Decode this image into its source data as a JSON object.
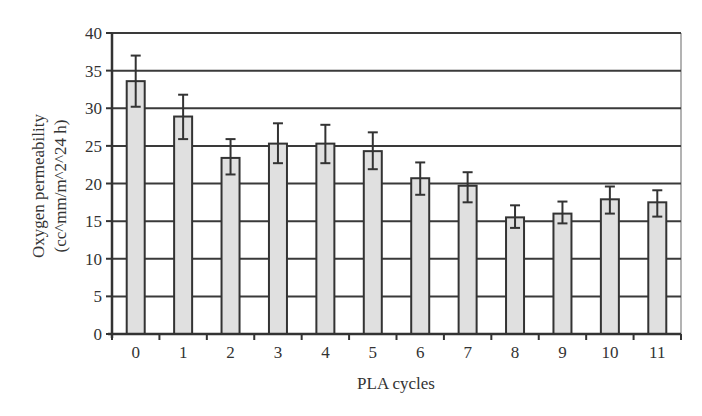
{
  "chart_data": {
    "type": "bar",
    "title": "",
    "xlabel": "PLA cycles",
    "ylabel": [
      "Oxygen permeability",
      "(cc^mm/m^2^24 h)"
    ],
    "categories": [
      "0",
      "1",
      "2",
      "3",
      "4",
      "5",
      "6",
      "7",
      "8",
      "9",
      "10",
      "11"
    ],
    "values": [
      33.6,
      28.9,
      23.4,
      25.3,
      25.3,
      24.3,
      20.7,
      19.7,
      15.5,
      16.0,
      17.9,
      17.5
    ],
    "error_upper": [
      37.0,
      31.8,
      25.9,
      28.0,
      27.8,
      26.8,
      22.8,
      21.5,
      17.1,
      17.6,
      19.6,
      19.1
    ],
    "error_lower": [
      30.2,
      25.9,
      21.2,
      22.7,
      22.7,
      21.9,
      18.5,
      17.5,
      14.1,
      14.7,
      16.0,
      15.6
    ],
    "ylim": [
      0,
      40
    ],
    "yticks": [
      "0",
      "5",
      "10",
      "15",
      "20",
      "25",
      "30",
      "35",
      "40"
    ],
    "grid": true,
    "legend": null,
    "colors": {
      "bar_fill": "#e0e0e0",
      "bar_stroke": "#333333",
      "grid": "#3a3a3a",
      "axis": "#333333",
      "plot_border": "#9a9a9a"
    }
  }
}
